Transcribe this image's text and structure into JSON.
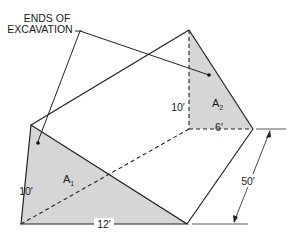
{
  "figure": {
    "callout": {
      "line1": "ENDS OF",
      "line2": "EXCAVATION"
    },
    "front_end": {
      "area_label": "A",
      "area_subscript": "1",
      "height": "10′",
      "width": "12′"
    },
    "back_end": {
      "area_label": "A",
      "area_subscript": "2",
      "height": "10′",
      "width": "6′"
    },
    "length": "50′",
    "colors": {
      "shade": "#d6d6d6",
      "line": "#222222"
    }
  }
}
